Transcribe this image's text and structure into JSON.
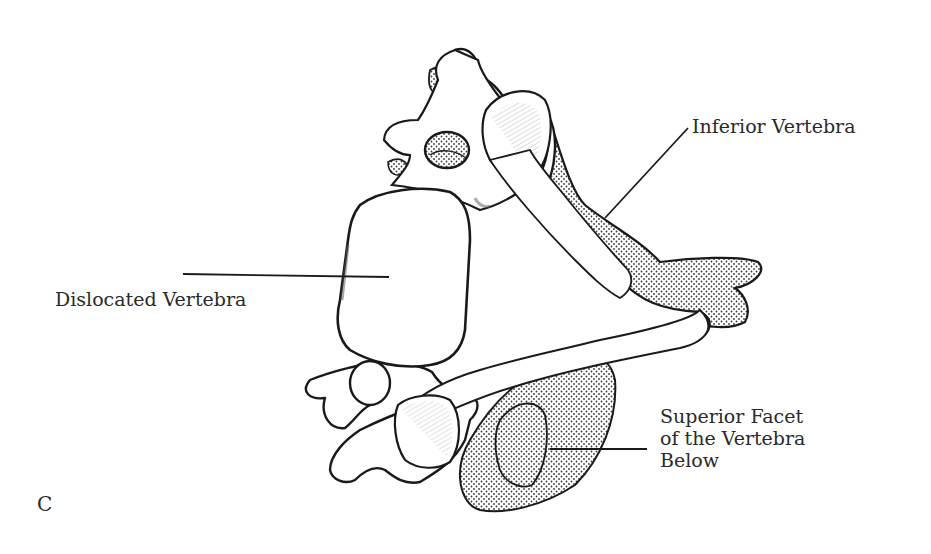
{
  "figure": {
    "panel_letter": "C"
  },
  "labels": {
    "inferior_vertebra": "Inferior Vertebra",
    "dislocated_vertebra": "Dislocated Vertebra",
    "superior_facet": {
      "line1": "Superior Facet",
      "line2": "of the Vertebra",
      "line3": "Below"
    }
  },
  "colors": {
    "ink": "#1a1a1a",
    "stipple": "#3a3a3a",
    "bone": "#ffffff",
    "background": "#ffffff"
  }
}
